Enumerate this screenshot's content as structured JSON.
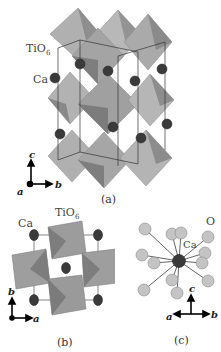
{
  "figure": {
    "panels": [
      {
        "id": "a",
        "caption": "(a)",
        "labels": {
          "polyhedron": "TiO6",
          "polyhedron_main": "TiO",
          "polyhedron_sub": "6",
          "atom": "Ca"
        },
        "axes": {
          "up": "c",
          "right": "b",
          "origin": "a"
        }
      },
      {
        "id": "b",
        "caption": "(b)",
        "labels": {
          "polyhedron": "TiO6",
          "polyhedron_main": "TiO",
          "polyhedron_sub": "6",
          "atom": "Ca"
        },
        "axes": {
          "up": "b",
          "right": "a"
        }
      },
      {
        "id": "c",
        "caption": "(c)",
        "labels": {
          "center_atom": "Ca",
          "ligand": "O"
        },
        "axes": {
          "up": "c",
          "right": "b",
          "left": "a"
        }
      }
    ],
    "colors": {
      "octahedron_light": "#b4b4b4",
      "octahedron_mid": "#9a9a9a",
      "octahedron_dark": "#7a7a7a",
      "ca_atom": "#3a3a3a",
      "o_atom": "#c8c8c8",
      "cell_line": "#333333"
    }
  }
}
